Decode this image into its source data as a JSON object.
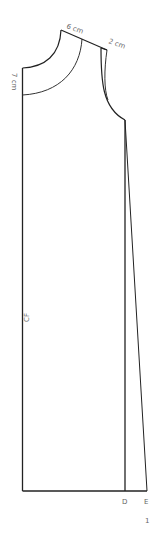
{
  "diagram": {
    "type": "sewing-pattern",
    "figure_number": "1",
    "labels": {
      "neck_width": "6 cm",
      "shoulder_extra": "2 cm",
      "neck_drop": "7 cm",
      "center_front": "CF",
      "point_d": "D",
      "point_e": "E"
    },
    "colors": {
      "line": "#222222",
      "text": "#666666",
      "background": "#ffffff"
    }
  }
}
